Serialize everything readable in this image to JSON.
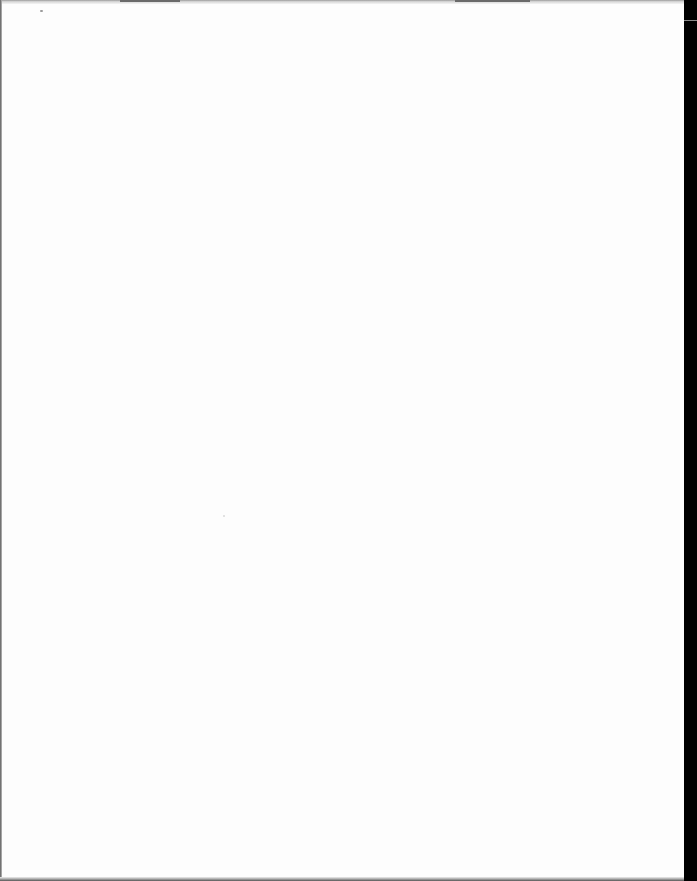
{
  "document": {
    "type": "scanned-page",
    "content": "blank",
    "background_color": "#ffffff",
    "scanner_bar_color": "#000000"
  }
}
